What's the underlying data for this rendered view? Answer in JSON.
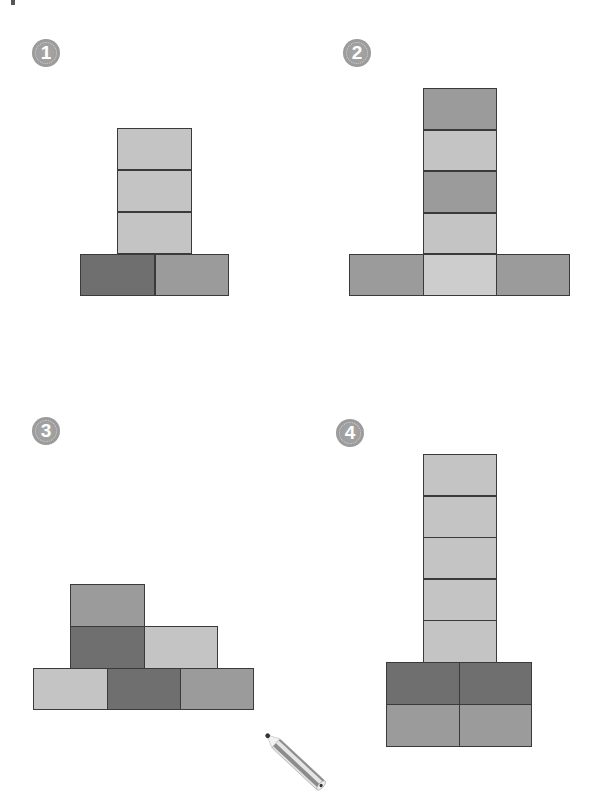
{
  "colors": {
    "light": "#c4c4c4",
    "lighter": "#cdcdcd",
    "medium": "#9b9b9b",
    "dark": "#6f6f6f",
    "outline": "#3a3a3a"
  },
  "figures": [
    {
      "number": "1",
      "badge": {
        "x": 32,
        "y": 39
      },
      "blocks": [
        {
          "x": 117,
          "y": 128,
          "w": 75,
          "h": 42,
          "tone": "light"
        },
        {
          "x": 117,
          "y": 170,
          "w": 75,
          "h": 42,
          "tone": "light"
        },
        {
          "x": 117,
          "y": 212,
          "w": 75,
          "h": 42,
          "tone": "light"
        },
        {
          "x": 80,
          "y": 254,
          "w": 75,
          "h": 42,
          "tone": "dark"
        },
        {
          "x": 155,
          "y": 254,
          "w": 74,
          "h": 42,
          "tone": "medium"
        }
      ]
    },
    {
      "number": "2",
      "badge": {
        "x": 343,
        "y": 39
      },
      "blocks": [
        {
          "x": 423,
          "y": 88,
          "w": 74,
          "h": 42,
          "tone": "medium"
        },
        {
          "x": 423,
          "y": 130,
          "w": 74,
          "h": 41,
          "tone": "light"
        },
        {
          "x": 423,
          "y": 171,
          "w": 74,
          "h": 42,
          "tone": "medium"
        },
        {
          "x": 423,
          "y": 213,
          "w": 74,
          "h": 41,
          "tone": "light"
        },
        {
          "x": 349,
          "y": 254,
          "w": 75,
          "h": 42,
          "tone": "medium"
        },
        {
          "x": 423,
          "y": 254,
          "w": 74,
          "h": 42,
          "tone": "lighter"
        },
        {
          "x": 496,
          "y": 254,
          "w": 74,
          "h": 42,
          "tone": "medium"
        }
      ]
    },
    {
      "number": "3",
      "badge": {
        "x": 32,
        "y": 417
      },
      "blocks": [
        {
          "x": 70,
          "y": 584,
          "w": 75,
          "h": 43,
          "tone": "medium"
        },
        {
          "x": 70,
          "y": 626,
          "w": 75,
          "h": 43,
          "tone": "dark"
        },
        {
          "x": 144,
          "y": 626,
          "w": 74,
          "h": 43,
          "tone": "light"
        },
        {
          "x": 33,
          "y": 668,
          "w": 75,
          "h": 42,
          "tone": "light"
        },
        {
          "x": 107,
          "y": 668,
          "w": 74,
          "h": 42,
          "tone": "dark"
        },
        {
          "x": 180,
          "y": 668,
          "w": 74,
          "h": 42,
          "tone": "medium"
        }
      ]
    },
    {
      "number": "4",
      "badge": {
        "x": 336,
        "y": 419
      },
      "blocks": [
        {
          "x": 423,
          "y": 454,
          "w": 74,
          "h": 42,
          "tone": "light"
        },
        {
          "x": 423,
          "y": 496,
          "w": 74,
          "h": 42,
          "tone": "light"
        },
        {
          "x": 423,
          "y": 537,
          "w": 74,
          "h": 42,
          "tone": "light"
        },
        {
          "x": 423,
          "y": 579,
          "w": 74,
          "h": 42,
          "tone": "light"
        },
        {
          "x": 423,
          "y": 620,
          "w": 74,
          "h": 43,
          "tone": "light"
        },
        {
          "x": 386,
          "y": 662,
          "w": 74,
          "h": 43,
          "tone": "dark"
        },
        {
          "x": 459,
          "y": 662,
          "w": 73,
          "h": 43,
          "tone": "dark"
        },
        {
          "x": 386,
          "y": 704,
          "w": 74,
          "h": 43,
          "tone": "medium"
        },
        {
          "x": 459,
          "y": 704,
          "w": 73,
          "h": 43,
          "tone": "medium"
        }
      ]
    }
  ],
  "decorations": {
    "pencil_icon": "pencil-icon"
  }
}
